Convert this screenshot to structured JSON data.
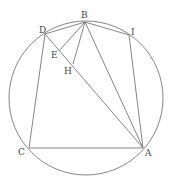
{
  "diagram": {
    "type": "geometry",
    "circle": {
      "cx": 86,
      "cy": 98,
      "r": 77
    },
    "points": {
      "A": {
        "x": 143,
        "y": 148,
        "label": "A",
        "lx": 145,
        "ly": 156
      },
      "B": {
        "x": 85,
        "y": 22,
        "label": "B",
        "lx": 81,
        "ly": 18
      },
      "C": {
        "x": 29,
        "y": 148,
        "label": "C",
        "lx": 18,
        "ly": 155
      },
      "D": {
        "x": 45,
        "y": 34,
        "label": "D",
        "lx": 39,
        "ly": 33
      },
      "E": {
        "x": 59,
        "y": 51,
        "label": "E",
        "lx": 51,
        "ly": 58
      },
      "H": {
        "x": 73,
        "y": 64,
        "label": "H",
        "lx": 64,
        "ly": 74
      },
      "I": {
        "x": 129,
        "y": 35,
        "label": "I",
        "lx": 131,
        "ly": 35
      }
    },
    "segments": [
      [
        "D",
        "B"
      ],
      [
        "B",
        "I"
      ],
      [
        "I",
        "A"
      ],
      [
        "D",
        "C"
      ],
      [
        "C",
        "A"
      ],
      [
        "D",
        "A"
      ],
      [
        "B",
        "E"
      ],
      [
        "B",
        "H"
      ],
      [
        "B",
        "A"
      ]
    ],
    "colors": {
      "stroke": "#777777",
      "label": "#444444",
      "background": "#ffffff"
    }
  }
}
